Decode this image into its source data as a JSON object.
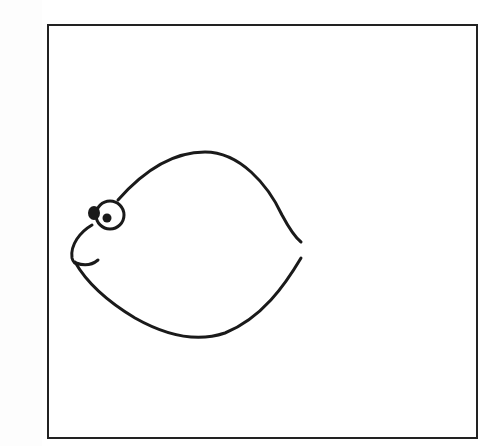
{
  "image": {
    "subject": "fish-line-drawing",
    "stroke_color": "#1a1a1a",
    "frame_color": "#222222",
    "background": "#ffffff"
  }
}
